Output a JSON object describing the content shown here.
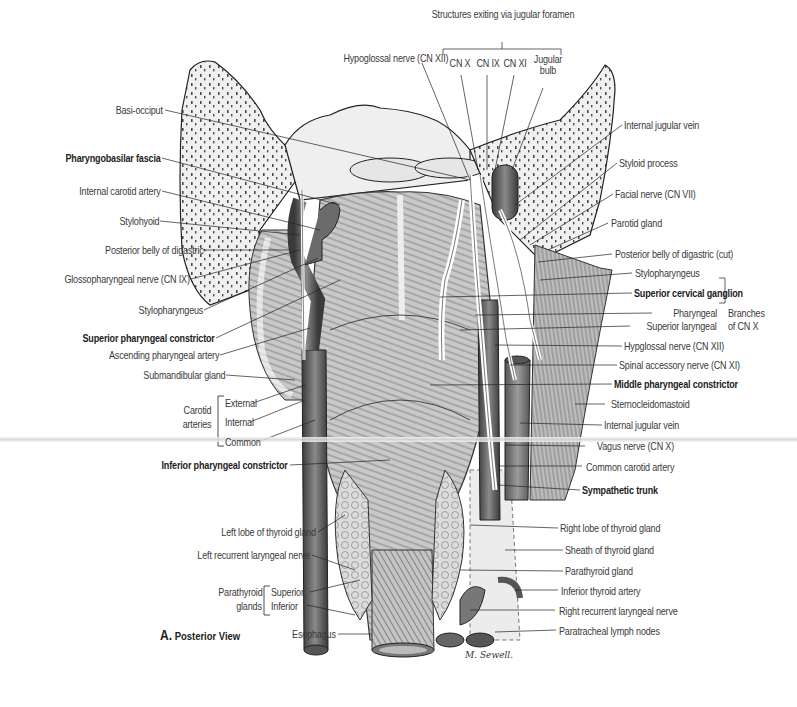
{
  "figure": {
    "caption_letter": "A.",
    "caption_text": "Posterior View",
    "signature": "M. Sewell."
  },
  "top_group": {
    "title": "Structures exiting via jugular foramen",
    "items": [
      "CN X",
      "CN IX",
      "CN XI",
      "Jugular bulb"
    ]
  },
  "labels_top": {
    "hypoglossal_xii": "Hypoglossal nerve (CN XII)"
  },
  "labels_left": [
    {
      "id": "basi-occiput",
      "text": "Basi-occiput",
      "bold": false
    },
    {
      "id": "pharyngobasilar-fascia",
      "text": "Pharyngobasilar fascia",
      "bold": true
    },
    {
      "id": "internal-carotid-artery",
      "text": "Internal carotid artery",
      "bold": false
    },
    {
      "id": "stylohyoid",
      "text": "Stylohyoid",
      "bold": false
    },
    {
      "id": "posterior-belly-of-digastric",
      "text": "Posterior belly of digastric",
      "bold": false
    },
    {
      "id": "glossopharyngeal-nerve",
      "text": "Glossopharyngeal nerve (CN IX)",
      "bold": false
    },
    {
      "id": "stylopharyngeus-left",
      "text": "Stylopharyngeus",
      "bold": false
    },
    {
      "id": "superior-pharyngeal-constrictor",
      "text": "Superior pharyngeal constrictor",
      "bold": true
    },
    {
      "id": "ascending-pharyngeal-artery",
      "text": "Ascending pharyngeal artery",
      "bold": false
    },
    {
      "id": "submandibular-gland",
      "text": "Submandibular gland",
      "bold": false
    },
    {
      "id": "inferior-pharyngeal-constrictor",
      "text": "Inferior pharyngeal constrictor",
      "bold": true
    },
    {
      "id": "left-lobe-thyroid",
      "text": "Left lobe of thyroid gland",
      "bold": false
    },
    {
      "id": "left-recurrent-laryngeal",
      "text": "Left recurrent laryngeal nerve",
      "bold": false
    },
    {
      "id": "esophagus",
      "text": "Esophagus",
      "bold": false
    }
  ],
  "carotid_group": {
    "title_line1": "Carotid",
    "title_line2": "arteries",
    "items": [
      "External",
      "Internal",
      "Common"
    ]
  },
  "parathyroid_group": {
    "title_line1": "Parathyroid",
    "title_line2": "glands",
    "items": [
      "Superior",
      "Inferior"
    ]
  },
  "labels_right": [
    {
      "id": "internal-jugular-vein-top",
      "text": "Internal jugular vein",
      "bold": false
    },
    {
      "id": "styloid-process",
      "text": "Styloid process",
      "bold": false
    },
    {
      "id": "facial-nerve",
      "text": "Facial nerve (CN VII)",
      "bold": false
    },
    {
      "id": "parotid-gland",
      "text": "Parotid gland",
      "bold": false
    },
    {
      "id": "posterior-belly-digastric-cut",
      "text": "Posterior belly of digastric (cut)",
      "bold": false
    },
    {
      "id": "stylopharyngeus-right",
      "text": "Stylopharyngeus",
      "bold": false
    },
    {
      "id": "superior-cervical-ganglion",
      "text": "Superior cervical ganglion",
      "bold": true
    },
    {
      "id": "hypoglossal-nerve-right",
      "text": "Hypglossal nerve (CN XII)",
      "bold": false
    },
    {
      "id": "spinal-accessory-nerve",
      "text": "Spinal accessory nerve (CN XI)",
      "bold": false
    },
    {
      "id": "middle-pharyngeal-constrictor",
      "text": "Middle pharyngeal constrictor",
      "bold": true
    },
    {
      "id": "sternocleidomastoid",
      "text": "Sternocleidomastoid",
      "bold": false
    },
    {
      "id": "internal-jugular-vein",
      "text": "Internal jugular vein",
      "bold": false
    },
    {
      "id": "vagus-nerve",
      "text": "Vagus nerve (CN X)",
      "bold": false
    },
    {
      "id": "common-carotid-artery",
      "text": "Common carotid artery",
      "bold": false
    },
    {
      "id": "sympathetic-trunk",
      "text": "Sympathetic trunk",
      "bold": true
    },
    {
      "id": "right-lobe-thyroid",
      "text": "Right lobe of thyroid gland",
      "bold": false
    },
    {
      "id": "sheath-thyroid",
      "text": "Sheath of thyroid gland",
      "bold": false
    },
    {
      "id": "parathyroid-gland",
      "text": "Parathyroid gland",
      "bold": false
    },
    {
      "id": "inferior-thyroid-artery",
      "text": "Inferior thyroid artery",
      "bold": false
    },
    {
      "id": "right-recurrent-laryngeal",
      "text": "Right recurrent laryngeal nerve",
      "bold": false
    },
    {
      "id": "paratracheal-lymph-nodes",
      "text": "Paratracheal lymph nodes",
      "bold": false
    }
  ],
  "cnx_branches": {
    "items": [
      "Pharyngeal",
      "Superior laryngeal"
    ],
    "title_line1": "Branches",
    "title_line2": "of CN X"
  }
}
